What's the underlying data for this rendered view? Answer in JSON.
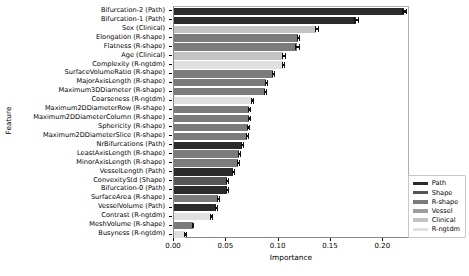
{
  "chart_data": {
    "type": "bar",
    "orientation": "horizontal",
    "title": "",
    "xlabel": "Importance",
    "ylabel": "Feature",
    "xlim": [
      0.0,
      0.2255
    ],
    "xticks": [
      0.0,
      0.05,
      0.1,
      0.15,
      0.2
    ],
    "xticklabels": [
      "0.00",
      "0.05",
      "0.10",
      "0.15",
      "0.20"
    ],
    "grid": false,
    "legend_position": "lower right",
    "legend": [
      {
        "name": "Path",
        "color": "#2b2b2b"
      },
      {
        "name": "Shape",
        "color": "#555555"
      },
      {
        "name": "R-shape",
        "color": "#7b7b7b"
      },
      {
        "name": "Vessel",
        "color": "#9d9d9d"
      },
      {
        "name": "Clinical",
        "color": "#c3c3c3"
      },
      {
        "name": "R-ngtdm",
        "color": "#e0e0e0"
      }
    ],
    "categories": [
      "Bifurcation-2 (Path)",
      "Bifurcation-1 (Path)",
      "Sex (Clinical)",
      "Elongation (R-shape)",
      "Flatness (R-shape)",
      "Age (Clinical)",
      "Complexity (R-ngtdm)",
      "SurfaceVolumeRatio (R-shape)",
      "MajorAxisLength (R-shape)",
      "Maximum3DDiameter (R-shape)",
      "Coarseness (R-ngtdm)",
      "Maximum2DDiameterRow (R-shape)",
      "Maximum2DDiameterColumn (R-shape)",
      "Sphericity (R-shape)",
      "Maximum2DDiameterSlice (R-shape)",
      "NrBifurcations (Path)",
      "LeastAxisLength (R-shape)",
      "MinorAxisLength (R-shape)",
      "VesselLength (Path)",
      "ConvexityStd (Shape)",
      "Bifurcation-0 (Path)",
      "SurfaceArea (R-shape)",
      "VesselVolume (Path)",
      "Contrast (R-ngtdm)",
      "MeshVolume (R-shape)",
      "Busyness (R-ngtdm)"
    ],
    "values": [
      0.22,
      0.174,
      0.136,
      0.1185,
      0.1175,
      0.1045,
      0.104,
      0.0945,
      0.088,
      0.087,
      0.0745,
      0.072,
      0.0715,
      0.0705,
      0.0695,
      0.065,
      0.062,
      0.061,
      0.0565,
      0.051,
      0.0505,
      0.042,
      0.04,
      0.0355,
      0.018,
      0.0105
    ],
    "errors": [
      0.002,
      0.0018,
      0.0016,
      0.0014,
      0.0015,
      0.0012,
      0.0012,
      0.0013,
      0.0012,
      0.0012,
      0.0011,
      0.001,
      0.001,
      0.001,
      0.001,
      0.001,
      0.0009,
      0.0009,
      0.0009,
      0.0009,
      0.0009,
      0.0008,
      0.0008,
      0.0008,
      0.0006,
      0.0005
    ],
    "groups": [
      "Path",
      "Path",
      "Clinical",
      "R-shape",
      "R-shape",
      "Clinical",
      "R-ngtdm",
      "R-shape",
      "R-shape",
      "R-shape",
      "R-ngtdm",
      "R-shape",
      "R-shape",
      "R-shape",
      "R-shape",
      "Path",
      "R-shape",
      "R-shape",
      "Path",
      "Shape",
      "Path",
      "R-shape",
      "Path",
      "R-ngtdm",
      "R-shape",
      "R-ngtdm"
    ]
  }
}
